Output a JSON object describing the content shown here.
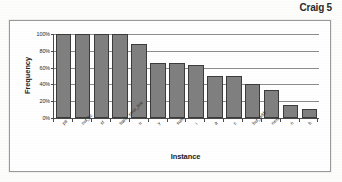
{
  "page": {
    "header_label": "Craig 5"
  },
  "chart": {
    "y_axis_title": "Frequency",
    "x_axis_title": "Instance"
  },
  "chart_data": {
    "type": "bar",
    "title": "",
    "xlabel": "Instance",
    "ylabel": "Frequency",
    "ylim": [
      0,
      100
    ],
    "ytick_labels": [
      "100%",
      "80%",
      "60%",
      "40%",
      "20%",
      "0%"
    ],
    "ytick_values": [
      100,
      80,
      60,
      40,
      20,
      0
    ],
    "grid": true,
    "legend": false,
    "bar_color": "#808080",
    "bar_edge_color": "#3c3c3c",
    "categories": [
      "ptr",
      "out_bc",
      "sf",
      "trans_error_line",
      "u",
      "y",
      "sum",
      "i",
      "a",
      "c",
      "buf_addr",
      "next",
      "n",
      "b"
    ],
    "values": [
      100,
      100,
      100,
      100,
      88,
      66,
      66,
      63,
      50,
      50,
      40,
      33,
      15,
      11
    ]
  }
}
